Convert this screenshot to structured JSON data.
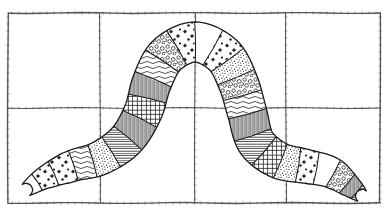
{
  "figure": {
    "background_color": "#ffffff",
    "ink_color": "#1a1a1a",
    "grid_color": "#555555"
  },
  "frame": {
    "name": "grid-frame",
    "x": 8,
    "y": 13,
    "width": 372,
    "height": 190,
    "columns": 4,
    "rows": 2,
    "vertical_gridlines_x": [
      100,
      195,
      286
    ],
    "horizontal_gridlines_y": [
      108
    ],
    "border_width": 1.4,
    "grid_width": 1.1,
    "tick_marks": true
  },
  "body": {
    "name": "segmented-worm",
    "segment_count": 26,
    "outline_width": 1.3,
    "path_kind": "arch",
    "left_tail_end": {
      "x": 22,
      "y": 196
    },
    "right_tail_end": {
      "x": 366,
      "y": 200
    },
    "apex": {
      "x": 195,
      "y": 38
    },
    "inner_arch": {
      "cx": 195,
      "cy": 118,
      "rx": 42,
      "ry": 62
    },
    "segments": [
      {
        "index": 0,
        "pattern": "blank",
        "t": 0.0
      },
      {
        "index": 1,
        "pattern": "stipple-star",
        "t": 0.04
      },
      {
        "index": 2,
        "pattern": "stipple-star",
        "t": 0.08
      },
      {
        "index": 3,
        "pattern": "wavy-line",
        "t": 0.12
      },
      {
        "index": 4,
        "pattern": "stipple-dense",
        "t": 0.16
      },
      {
        "index": 5,
        "pattern": "ladder",
        "t": 0.2
      },
      {
        "index": 6,
        "pattern": "vertical-fine",
        "t": 0.24
      },
      {
        "index": 7,
        "pattern": "grid-cross",
        "t": 0.28
      },
      {
        "index": 8,
        "pattern": "vertical-fine",
        "t": 0.32
      },
      {
        "index": 9,
        "pattern": "wavy-line",
        "t": 0.358
      },
      {
        "index": 10,
        "pattern": "pebble",
        "t": 0.396
      },
      {
        "index": 11,
        "pattern": "stipple-star",
        "t": 0.434
      },
      {
        "index": 12,
        "pattern": "blank",
        "t": 0.47
      },
      {
        "index": 13,
        "pattern": "stipple-star",
        "t": 0.506
      },
      {
        "index": 14,
        "pattern": "stipple-dense",
        "t": 0.542
      },
      {
        "index": 15,
        "pattern": "pebble",
        "t": 0.578
      },
      {
        "index": 16,
        "pattern": "wavy-line",
        "t": 0.614
      },
      {
        "index": 17,
        "pattern": "vertical-fine",
        "t": 0.65
      },
      {
        "index": 18,
        "pattern": "ladder",
        "t": 0.69
      },
      {
        "index": 19,
        "pattern": "grid-cross",
        "t": 0.73
      },
      {
        "index": 20,
        "pattern": "stipple-dense",
        "t": 0.77
      },
      {
        "index": 21,
        "pattern": "stipple-star",
        "t": 0.81
      },
      {
        "index": 22,
        "pattern": "blank",
        "t": 0.85
      },
      {
        "index": 23,
        "pattern": "pebble",
        "t": 0.89
      },
      {
        "index": 24,
        "pattern": "vertical-fine",
        "t": 0.93
      },
      {
        "index": 25,
        "pattern": "ladder",
        "t": 0.968
      }
    ]
  }
}
